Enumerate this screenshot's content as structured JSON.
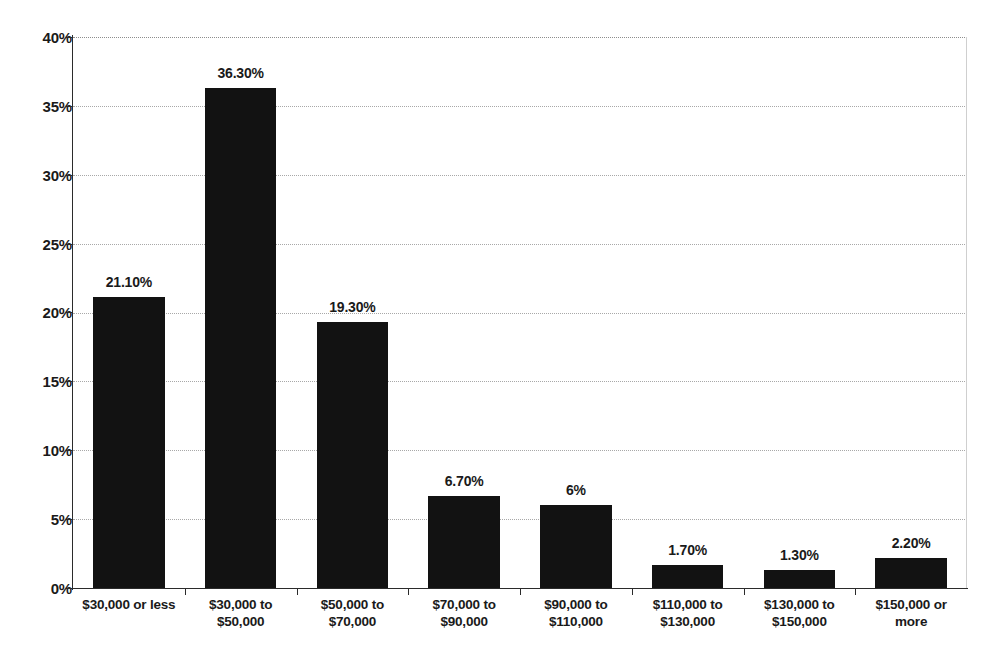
{
  "chart_data": {
    "type": "bar",
    "title": "",
    "subtitle": "",
    "xlabel": "",
    "ylabel": "",
    "ylim": [
      0,
      40
    ],
    "ytick_labels": [
      "40%",
      "35%",
      "30%",
      "25%",
      "20%",
      "15%",
      "10%",
      "5%",
      "0%"
    ],
    "ytick_values": [
      40,
      35,
      30,
      25,
      20,
      15,
      10,
      5,
      0
    ],
    "grid": true,
    "legend": false,
    "legend_position": "none",
    "bar_color": "#121212",
    "categories": [
      "$30,000 or less",
      "$30,000 to $50,000",
      "$50,000 to $70,000",
      "$70,000 to $90,000",
      "$90,000 to $110,000",
      "$110,000 to $130,000",
      "$130,000 to $150,000",
      "$150,000 or more"
    ],
    "category_lines": [
      [
        "$30,000 or less"
      ],
      [
        "$30,000 to",
        "$50,000"
      ],
      [
        "$50,000 to",
        "$70,000"
      ],
      [
        "$70,000 to",
        "$90,000"
      ],
      [
        "$90,000 to",
        "$110,000"
      ],
      [
        "$110,000 to",
        "$130,000"
      ],
      [
        "$130,000 to",
        "$150,000"
      ],
      [
        "$150,000 or",
        "more"
      ]
    ],
    "values": [
      21.1,
      36.3,
      19.3,
      6.7,
      6.0,
      1.7,
      1.3,
      2.2
    ],
    "data_labels": [
      "21.10%",
      "36.30%",
      "19.30%",
      "6.70%",
      "6%",
      "1.70%",
      "1.30%",
      "2.20%"
    ]
  }
}
